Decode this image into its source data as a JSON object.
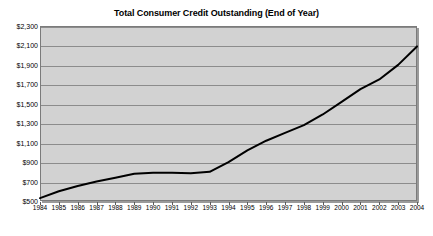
{
  "chart_data": {
    "type": "line",
    "title": "Total Consumer Credit Outstanding (End of Year)",
    "xlabel": "",
    "ylabel": "",
    "grid": true,
    "legend": false,
    "xlim": [
      1984,
      2004
    ],
    "ylim": [
      500,
      2300
    ],
    "ytick_labels": [
      "$2,300",
      "$2,100",
      "$1,900",
      "$1,700",
      "$1,500",
      "$1,300",
      "$1,100",
      "$900",
      "$700",
      "$500"
    ],
    "ytick_values": [
      2300,
      2100,
      1900,
      1700,
      1500,
      1300,
      1100,
      900,
      700,
      500
    ],
    "categories": [
      "1984",
      "1985",
      "1986",
      "1987",
      "1988",
      "1989",
      "1990",
      "1991",
      "1992",
      "1993",
      "1994",
      "1995",
      "1996",
      "1997",
      "1998",
      "1999",
      "2000",
      "2001",
      "2002",
      "2003",
      "2004"
    ],
    "x": [
      1984,
      1985,
      1986,
      1987,
      1988,
      1989,
      1990,
      1991,
      1992,
      1993,
      1994,
      1995,
      1996,
      1997,
      1998,
      1999,
      2000,
      2001,
      2002,
      2003,
      2004
    ],
    "values": [
      530,
      600,
      655,
      700,
      740,
      780,
      790,
      790,
      785,
      800,
      900,
      1020,
      1120,
      1200,
      1280,
      1390,
      1520,
      1650,
      1750,
      1900,
      2090
    ],
    "series": [
      {
        "name": "Total Consumer Credit Outstanding",
        "color": "#000000",
        "values": [
          530,
          600,
          655,
          700,
          740,
          780,
          790,
          790,
          785,
          800,
          900,
          1020,
          1120,
          1200,
          1280,
          1390,
          1520,
          1650,
          1750,
          1900,
          2090
        ]
      }
    ]
  },
  "style": {
    "plot_background": "#d2d2d2",
    "gridline_color": "#8c8c8c",
    "frame_color": "#7b7b7b",
    "line_color": "#000000",
    "page_background": "#ffffff"
  }
}
